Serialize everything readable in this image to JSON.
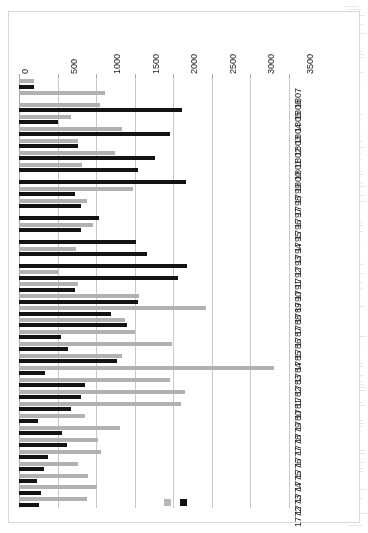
{
  "figure": {
    "orientation_deg": 180,
    "background": "#ffffff",
    "frame_border": "#d8d8d8"
  },
  "legend": {
    "position": "top-centre",
    "entries": [
      {
        "name": "series-1-swatch",
        "label": "",
        "color": "#131313"
      },
      {
        "name": "series-2-swatch",
        "label": "",
        "color": "#b8b8b8"
      }
    ]
  },
  "chart_data": {
    "type": "bar",
    "orientation": "horizontal",
    "title": "",
    "xlabel": "",
    "ylabel": "",
    "xlim": [
      0,
      3500
    ],
    "xticks": [
      0,
      500,
      1000,
      1500,
      2000,
      2500,
      3000,
      3500
    ],
    "grid": true,
    "legend_position": "top",
    "categories": [
      "1772",
      "1773",
      "1774",
      "1775",
      "1776",
      "1777",
      "1778",
      "1779",
      "1780",
      "1781",
      "1782",
      "1783",
      "1784",
      "1785",
      "1786",
      "1787",
      "1788",
      "1789",
      "1790",
      "1791",
      "1792",
      "1793",
      "1794",
      "1795",
      "1796",
      "1797",
      "1798",
      "1799",
      "1800",
      "1801",
      "1802",
      "1803",
      "1804",
      "1805",
      "1806",
      "1807"
    ],
    "series": [
      {
        "name": "Series 1",
        "color": "#131313",
        "values": [
          260,
          280,
          240,
          330,
          370,
          620,
          560,
          250,
          680,
          800,
          860,
          340,
          1270,
          640,
          540,
          1400,
          1190,
          1540,
          730,
          2060,
          2180,
          1660,
          1520,
          810,
          1040,
          810,
          720,
          2160,
          1540,
          1760,
          760,
          1960,
          500,
          2110,
          0,
          200
        ]
      },
      {
        "name": "Series 2",
        "color": "#b2b2b2",
        "values": [
          880,
          1010,
          900,
          770,
          1060,
          1020,
          1310,
          860,
          2100,
          2150,
          1960,
          3310,
          1340,
          1990,
          1500,
          1370,
          2420,
          1560,
          760,
          500,
          0,
          740,
          0,
          960,
          0,
          880,
          1480,
          0,
          820,
          1240,
          760,
          1330,
          680,
          1050,
          1110,
          190
        ]
      }
    ]
  }
}
